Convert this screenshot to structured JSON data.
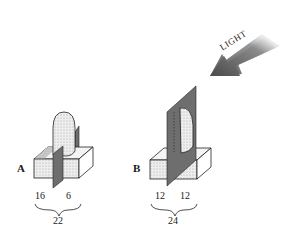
{
  "figure": {
    "light_label": "LIGHT",
    "panels": [
      {
        "id": "A",
        "label": "A",
        "left_value": "16",
        "right_value": "6",
        "total": "22",
        "description": "Coleoptile tip on agar block with barrier partially inserted; shaded side vs lit side split"
      },
      {
        "id": "B",
        "label": "B",
        "left_value": "12",
        "right_value": "12",
        "total": "24",
        "description": "Coleoptile tip with barrier fully dividing tip and agar block"
      }
    ],
    "colors": {
      "barrier": "#6e6e6e",
      "block_face": "#e6e6e6",
      "block_top": "#f4f4f4",
      "arrow": "#5a5a5a",
      "line": "#222222"
    }
  }
}
